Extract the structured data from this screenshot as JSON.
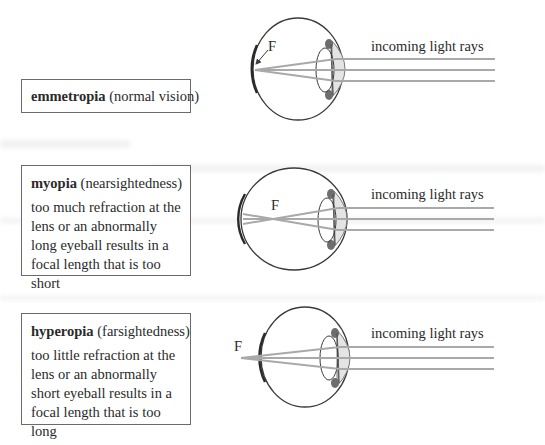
{
  "conditions": [
    {
      "id": "emmetropia",
      "term": "emmetropia",
      "gloss": "(normal vision)",
      "description": ""
    },
    {
      "id": "myopia",
      "term": "myopia",
      "gloss": "(nearsightedness)",
      "description": "too much refraction at the lens or an abnormally long eyeball results in a focal length that is too short"
    },
    {
      "id": "hyperopia",
      "term": "hyperopia",
      "gloss": "(farsightedness)",
      "description": "too little refraction at the lens or an abnormally short eyeball results in a focal length that is too long"
    }
  ],
  "diagrams": [
    {
      "focal_label": "F",
      "rays_label": "incoming light rays"
    },
    {
      "focal_label": "F",
      "rays_label": "incoming light rays"
    },
    {
      "focal_label": "F",
      "rays_label": "incoming light rays"
    }
  ],
  "colors": {
    "outline": "#3a3a3a",
    "ray": "#a9a9a9",
    "cornea_fill": "#e4e4e4",
    "iris": "#6e6e6e",
    "box_border": "#6a6a6a"
  }
}
